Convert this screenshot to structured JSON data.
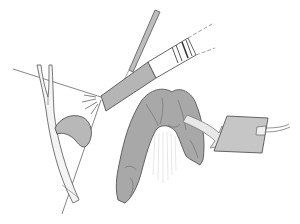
{
  "figure": {
    "labels": [],
    "colors": {
      "background": "#ffffff",
      "stroke": "#555555",
      "tissue_fill": "#a9a9a9",
      "scope_fill": "#b5b5b5",
      "arrow_fill": "#e6e6e6",
      "pad_fill": "#c4c4c4",
      "duct_fill": "#f2f2f2"
    },
    "elements": {
      "light_cone": "light-cone",
      "duct": "branching-duct",
      "pouch": "pouch",
      "scope": "endoscope",
      "rod": "instrument-rod",
      "colon": "colon-segment",
      "arrow": "curved-arrow",
      "pad": "collection-pad",
      "wire": "lead-wire"
    }
  }
}
